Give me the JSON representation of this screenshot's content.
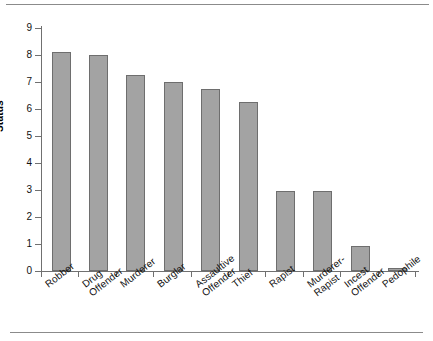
{
  "chart_data": {
    "type": "bar",
    "title": "",
    "xlabel": "",
    "ylabel": "Status",
    "ylim": [
      0,
      9
    ],
    "grid": false,
    "legend": "none",
    "yticks": [
      "0",
      "1",
      "2",
      "3",
      "4",
      "5",
      "6",
      "7",
      "8",
      "9"
    ],
    "categories": [
      "Robber",
      "Drug\nOffender",
      "Murderer",
      "Burglar",
      "Assaultive\nOffender",
      "Thief",
      "Rapist",
      "Murderer-\nRapist",
      "Incest\nOffender",
      "Pedophile"
    ],
    "values": [
      8.1,
      8.0,
      7.25,
      7.0,
      6.75,
      6.25,
      2.95,
      2.95,
      0.93,
      0.12
    ],
    "colors": {
      "bar_fill": "#a3a3a3",
      "bar_stroke": "#6e6e6e",
      "axis": "#707070",
      "text": "#111111",
      "rule": "#8b8b8b",
      "background": "#ffffff"
    }
  }
}
